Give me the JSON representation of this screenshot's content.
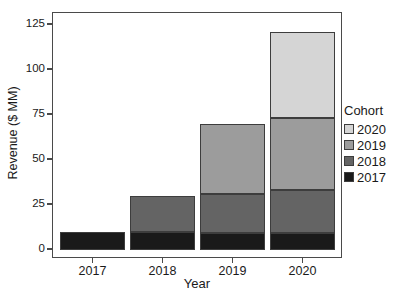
{
  "chart_data": {
    "type": "bar",
    "stacked": true,
    "title": "",
    "xlabel": "Year",
    "ylabel": "Revenue ($ MM)",
    "categories": [
      "2017",
      "2018",
      "2019",
      "2020"
    ],
    "series": [
      {
        "name": "2017",
        "color": "#1a1a1a",
        "values": [
          10,
          10,
          9,
          9
        ]
      },
      {
        "name": "2018",
        "color": "#646464",
        "values": [
          0,
          20,
          22,
          24
        ]
      },
      {
        "name": "2019",
        "color": "#9c9c9c",
        "values": [
          0,
          0,
          39,
          40
        ]
      },
      {
        "name": "2020",
        "color": "#d5d5d5",
        "values": [
          0,
          0,
          0,
          48
        ]
      }
    ],
    "totals": [
      10,
      30,
      70,
      121
    ],
    "y_ticks": [
      0,
      25,
      50,
      75,
      100,
      125
    ],
    "ylim": [
      0,
      130
    ],
    "grid": false,
    "panel_border": true,
    "legend_position": "right",
    "legend_title": "Cohort",
    "legend_items_top_to_bottom": [
      "2020",
      "2019",
      "2018",
      "2017"
    ],
    "colors": {
      "cohort_2017": "#1a1a1a",
      "cohort_2018": "#646464",
      "cohort_2019": "#9c9c9c",
      "cohort_2020": "#d5d5d5",
      "axis_and_border": "#4a4a4a",
      "text": "#1a1a1a",
      "background": "#ffffff"
    }
  }
}
